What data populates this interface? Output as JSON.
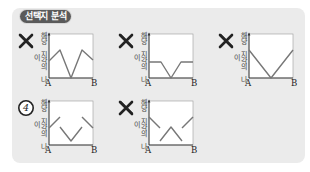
{
  "header": {
    "badge_label": "선택지 분석"
  },
  "axis": {
    "y_label": "해당 지각의 나이",
    "x_start": "A",
    "x_end": "B"
  },
  "colors": {
    "panel": "#ebebeb",
    "badge": "#5a5a5a",
    "line": "#777777",
    "mark": "#222222"
  },
  "options": [
    {
      "id": 1,
      "mark": "x-mark",
      "mark_text": "",
      "marked_correct": false,
      "segments": [
        [
          [
            0,
            29
          ],
          [
            11,
            18
          ],
          [
            22,
            46
          ],
          [
            33,
            18
          ],
          [
            44,
            28
          ]
        ]
      ]
    },
    {
      "id": 2,
      "mark": "x-mark",
      "mark_text": "",
      "marked_correct": false,
      "segments": [
        [
          [
            0,
            30
          ],
          [
            12,
            30
          ],
          [
            22,
            46
          ],
          [
            32,
            30
          ],
          [
            44,
            30
          ]
        ]
      ]
    },
    {
      "id": 3,
      "mark": "x-mark",
      "mark_text": "",
      "marked_correct": false,
      "segments": [
        [
          [
            0,
            18
          ],
          [
            22,
            46
          ],
          [
            44,
            18
          ]
        ]
      ]
    },
    {
      "id": 4,
      "mark": "circled-number",
      "mark_text": "4",
      "marked_correct": true,
      "segments": [
        [
          [
            0,
            29
          ],
          [
            11,
            18
          ]
        ],
        [
          [
            11,
            28
          ],
          [
            22,
            42
          ],
          [
            33,
            28
          ]
        ],
        [
          [
            33,
            18
          ],
          [
            44,
            29
          ]
        ]
      ]
    },
    {
      "id": 5,
      "mark": "x-mark",
      "mark_text": "",
      "marked_correct": false,
      "segments": [
        [
          [
            0,
            18
          ],
          [
            11,
            29
          ]
        ],
        [
          [
            11,
            42
          ],
          [
            22,
            28
          ],
          [
            33,
            42
          ]
        ],
        [
          [
            33,
            29
          ],
          [
            44,
            18
          ]
        ]
      ]
    }
  ],
  "chart_data": {
    "type": "line",
    "title": "선택지 분석",
    "xlabel": "A → B",
    "ylabel": "해당 지각의 나이",
    "x_ticks": [
      "A",
      "B"
    ],
    "grid": false,
    "series": [
      {
        "name": "option 1 (X)",
        "x": [
          0,
          0.25,
          0.5,
          0.75,
          1
        ],
        "y": [
          0.4,
          0.65,
          0,
          0.65,
          0.4
        ]
      },
      {
        "name": "option 2 (X)",
        "x": [
          0,
          0.27,
          0.5,
          0.73,
          1
        ],
        "y": [
          0.35,
          0.35,
          0,
          0.35,
          0.35
        ]
      },
      {
        "name": "option 3 (X)",
        "x": [
          0,
          0.5,
          1
        ],
        "y": [
          0.6,
          0,
          0.6
        ]
      },
      {
        "name": "option 4 (④)",
        "x": [
          0,
          0.25,
          0.25,
          0.5,
          0.75,
          0.75,
          1
        ],
        "y": [
          0.4,
          0.65,
          0.4,
          0.1,
          0.4,
          0.65,
          0.4
        ]
      },
      {
        "name": "option 5 (X)",
        "x": [
          0,
          0.25,
          0.25,
          0.5,
          0.75,
          0.75,
          1
        ],
        "y": [
          0.65,
          0.4,
          0.1,
          0.4,
          0.1,
          0.4,
          0.65
        ]
      }
    ]
  }
}
